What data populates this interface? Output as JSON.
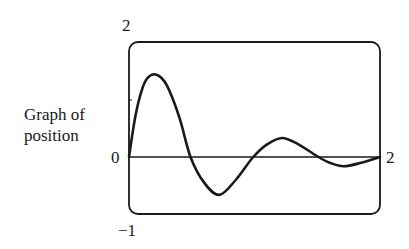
{
  "chart_data": {
    "type": "line",
    "title": "",
    "xlabel": "",
    "ylabel": "Graph of position",
    "ylabel_lines": [
      "Graph of",
      "position"
    ],
    "xlim": [
      0,
      2
    ],
    "ylim": [
      -1,
      2
    ],
    "grid": false,
    "legend": null,
    "tick_labels": {
      "y_top": "2",
      "y_zero": "0",
      "y_bottom": "−1",
      "x_right": "2"
    },
    "series": [
      {
        "name": "position",
        "x": [
          0,
          0.05,
          0.1,
          0.15,
          0.22,
          0.3,
          0.4,
          0.49,
          0.6,
          0.72,
          0.85,
          0.99,
          1.1,
          1.22,
          1.35,
          1.51,
          1.6,
          1.71,
          1.85,
          2.0
        ],
        "y": [
          0,
          0.7,
          1.15,
          1.38,
          1.43,
          1.25,
          0.7,
          0,
          -0.45,
          -0.66,
          -0.4,
          0,
          0.22,
          0.33,
          0.22,
          0,
          -0.1,
          -0.16,
          -0.1,
          0
        ]
      }
    ]
  },
  "colors": {
    "line": "#1a1a1a",
    "frame": "#1a1a1a",
    "background": "#ffffff"
  }
}
